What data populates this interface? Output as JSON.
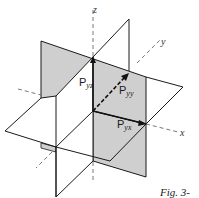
{
  "figure": {
    "caption": "Fig. 3-",
    "axes": {
      "x": "x",
      "y": "y",
      "z": "z"
    },
    "vectors": [
      {
        "name": "P",
        "subscript": "yz",
        "direction": "z"
      },
      {
        "name": "P",
        "subscript": "yy",
        "direction": "y"
      },
      {
        "name": "P",
        "subscript": "yx",
        "direction": "x"
      }
    ],
    "colors": {
      "plane_shaded": "#cfcfcf",
      "line": "#1a1a1a",
      "background": "#ffffff"
    }
  }
}
